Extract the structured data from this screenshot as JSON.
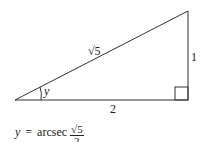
{
  "diagram": {
    "type": "right-triangle",
    "sides": {
      "hypotenuse": "√5",
      "opposite": "1",
      "adjacent": "2"
    },
    "angle_label": "y",
    "right_angle_marker": true
  },
  "formula": {
    "lhs": "y",
    "equals": "=",
    "function": "arcsec",
    "numerator": "√5",
    "denominator": "2"
  }
}
